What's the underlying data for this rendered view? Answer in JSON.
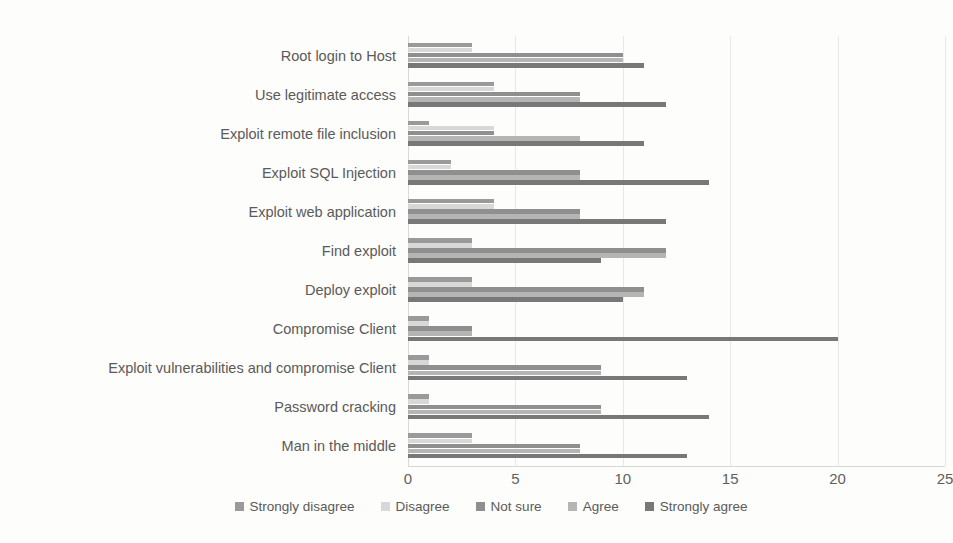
{
  "chart_data": {
    "type": "bar",
    "orientation": "horizontal",
    "title": "",
    "subtitle": "",
    "xlabel": "",
    "ylabel": "",
    "xlim": [
      0,
      25
    ],
    "xticks": [
      "0",
      "5",
      "10",
      "15",
      "20",
      "25"
    ],
    "xtick_values": [
      0,
      5,
      10,
      15,
      20,
      25
    ],
    "grid": true,
    "grid_axis": "x",
    "legend_position": "bottom",
    "categories": [
      "Root login to Host",
      "Use legitimate access",
      "Exploit remote file inclusion",
      "Exploit SQL Injection",
      "Exploit web application",
      "Find exploit",
      "Deploy exploit",
      "Compromise Client",
      "Exploit vulnerabilities and compromise Client",
      "Password cracking",
      "Man in the middle"
    ],
    "series": [
      {
        "name": "Strongly disagree",
        "color": "#9a9a9a",
        "values": [
          3,
          4,
          1,
          2,
          4,
          3,
          3,
          1,
          1,
          1,
          3
        ]
      },
      {
        "name": "Disagree",
        "color": "#d8d8d8",
        "values": [
          3,
          4,
          4,
          2,
          4,
          3,
          3,
          1,
          1,
          1,
          3
        ]
      },
      {
        "name": "Not sure",
        "color": "#8f8f8f",
        "values": [
          10,
          8,
          4,
          8,
          8,
          12,
          11,
          3,
          9,
          9,
          8
        ]
      },
      {
        "name": "Agree",
        "color": "#b5b5b5",
        "values": [
          10,
          8,
          8,
          8,
          8,
          12,
          11,
          3,
          9,
          9,
          8
        ]
      },
      {
        "name": "Strongly agree",
        "color": "#787878",
        "values": [
          11,
          12,
          11,
          14,
          12,
          9,
          10,
          20,
          13,
          14,
          13
        ]
      }
    ]
  }
}
